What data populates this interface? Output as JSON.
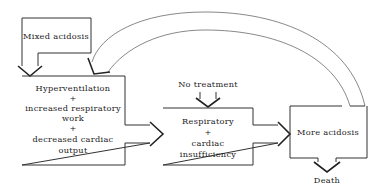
{
  "diagram": {
    "nodes": {
      "mixed_acidosis": {
        "label": "Mixed acidosis"
      },
      "compensation": {
        "lines": [
          "Hyperventilation",
          "+",
          "increased respiratory",
          "work",
          "+",
          "decreased cardiac",
          "output"
        ]
      },
      "no_treatment": {
        "label": "No treatment"
      },
      "insufficiency": {
        "lines": [
          "Respiratory",
          "+",
          "cardiac",
          "insufficiency"
        ]
      },
      "more_acidosis": {
        "label": "More acidosis"
      },
      "death": {
        "label": "Death"
      }
    },
    "edges": [
      {
        "from": "mixed_acidosis",
        "to": "compensation"
      },
      {
        "from": "compensation",
        "to": "insufficiency"
      },
      {
        "from": "no_treatment",
        "to": "insufficiency"
      },
      {
        "from": "insufficiency",
        "to": "more_acidosis"
      },
      {
        "from": "more_acidosis",
        "to": "compensation",
        "style": "curved-feedback"
      },
      {
        "from": "more_acidosis",
        "to": "death"
      }
    ]
  }
}
